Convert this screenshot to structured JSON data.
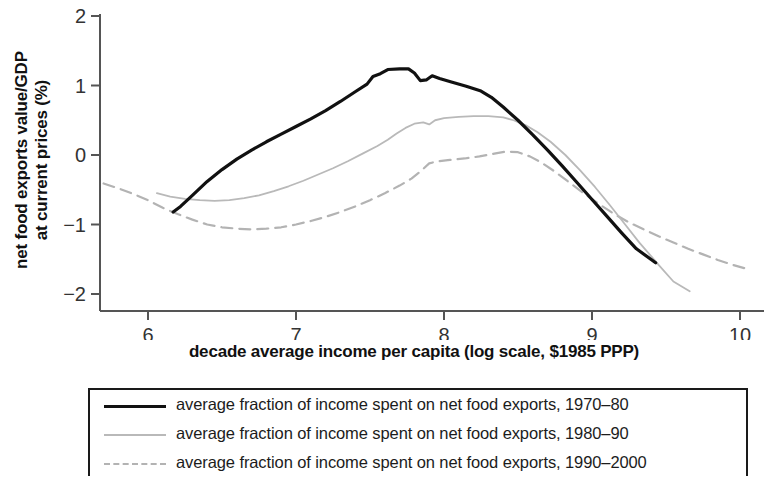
{
  "chart_data": {
    "type": "line",
    "title": "",
    "xlabel": "decade average income per capita (log scale, $1985 PPP)",
    "ylabel": "net food exports value/GDP\nat current prices (%)",
    "xlim": [
      5.62,
      10.1
    ],
    "ylim": [
      -2.15,
      2.15
    ],
    "xticks": [
      6,
      7,
      8,
      9,
      10
    ],
    "yticks": [
      2,
      1,
      0,
      -1,
      -2
    ],
    "xtick_labels": [
      "6",
      "7",
      "8",
      "9",
      "10"
    ],
    "ytick_labels": [
      "2",
      "1",
      "0",
      "−1",
      "−2"
    ],
    "grid": false,
    "legend_position": "below-axes",
    "series": [
      {
        "name": "average fraction of income spent on net food exports, 1970–80",
        "style": "solid",
        "color": "#111111",
        "width": 3.2,
        "points": [
          [
            6.17,
            -0.82
          ],
          [
            6.22,
            -0.74
          ],
          [
            6.3,
            -0.58
          ],
          [
            6.4,
            -0.38
          ],
          [
            6.5,
            -0.21
          ],
          [
            6.6,
            -0.06
          ],
          [
            6.7,
            0.07
          ],
          [
            6.8,
            0.19
          ],
          [
            6.9,
            0.3
          ],
          [
            7.0,
            0.41
          ],
          [
            7.1,
            0.52
          ],
          [
            7.2,
            0.64
          ],
          [
            7.3,
            0.77
          ],
          [
            7.4,
            0.91
          ],
          [
            7.48,
            1.02
          ],
          [
            7.52,
            1.13
          ],
          [
            7.57,
            1.17
          ],
          [
            7.62,
            1.23
          ],
          [
            7.7,
            1.24
          ],
          [
            7.76,
            1.24
          ],
          [
            7.8,
            1.18
          ],
          [
            7.84,
            1.07
          ],
          [
            7.88,
            1.08
          ],
          [
            7.92,
            1.14
          ],
          [
            7.97,
            1.1
          ],
          [
            8.05,
            1.05
          ],
          [
            8.15,
            0.99
          ],
          [
            8.25,
            0.92
          ],
          [
            8.32,
            0.83
          ],
          [
            8.4,
            0.69
          ],
          [
            8.5,
            0.5
          ],
          [
            8.6,
            0.29
          ],
          [
            8.7,
            0.07
          ],
          [
            8.8,
            -0.16
          ],
          [
            8.9,
            -0.4
          ],
          [
            9.0,
            -0.64
          ],
          [
            9.1,
            -0.88
          ],
          [
            9.2,
            -1.12
          ],
          [
            9.3,
            -1.35
          ],
          [
            9.43,
            -1.55
          ]
        ]
      },
      {
        "name": "average fraction of income spent on net food exports, 1980–90",
        "style": "solid",
        "color": "#b9b9b9",
        "width": 1.8,
        "points": [
          [
            6.06,
            -0.55
          ],
          [
            6.15,
            -0.6
          ],
          [
            6.25,
            -0.63
          ],
          [
            6.35,
            -0.65
          ],
          [
            6.45,
            -0.66
          ],
          [
            6.55,
            -0.65
          ],
          [
            6.65,
            -0.62
          ],
          [
            6.75,
            -0.58
          ],
          [
            6.85,
            -0.52
          ],
          [
            6.95,
            -0.45
          ],
          [
            7.05,
            -0.37
          ],
          [
            7.15,
            -0.28
          ],
          [
            7.25,
            -0.19
          ],
          [
            7.35,
            -0.09
          ],
          [
            7.45,
            0.02
          ],
          [
            7.55,
            0.13
          ],
          [
            7.62,
            0.22
          ],
          [
            7.68,
            0.31
          ],
          [
            7.74,
            0.39
          ],
          [
            7.8,
            0.45
          ],
          [
            7.86,
            0.47
          ],
          [
            7.9,
            0.44
          ],
          [
            7.94,
            0.5
          ],
          [
            8.0,
            0.53
          ],
          [
            8.1,
            0.55
          ],
          [
            8.2,
            0.56
          ],
          [
            8.3,
            0.56
          ],
          [
            8.4,
            0.54
          ],
          [
            8.47,
            0.5
          ],
          [
            8.55,
            0.43
          ],
          [
            8.63,
            0.33
          ],
          [
            8.72,
            0.19
          ],
          [
            8.82,
            0.0
          ],
          [
            8.92,
            -0.22
          ],
          [
            9.02,
            -0.46
          ],
          [
            9.12,
            -0.72
          ],
          [
            9.22,
            -0.99
          ],
          [
            9.32,
            -1.26
          ],
          [
            9.45,
            -1.58
          ],
          [
            9.55,
            -1.82
          ],
          [
            9.66,
            -1.96
          ]
        ]
      },
      {
        "name": "average fraction of income spent on net food exports, 1990–2000",
        "style": "dashed",
        "color": "#b3b3b3",
        "width": 2.2,
        "points": [
          [
            5.7,
            -0.41
          ],
          [
            5.8,
            -0.48
          ],
          [
            5.9,
            -0.56
          ],
          [
            6.0,
            -0.65
          ],
          [
            6.1,
            -0.76
          ],
          [
            6.2,
            -0.85
          ],
          [
            6.3,
            -0.93
          ],
          [
            6.4,
            -1.0
          ],
          [
            6.5,
            -1.04
          ],
          [
            6.6,
            -1.06
          ],
          [
            6.7,
            -1.07
          ],
          [
            6.8,
            -1.06
          ],
          [
            6.9,
            -1.04
          ],
          [
            7.0,
            -1.0
          ],
          [
            7.1,
            -0.95
          ],
          [
            7.2,
            -0.89
          ],
          [
            7.3,
            -0.82
          ],
          [
            7.4,
            -0.74
          ],
          [
            7.5,
            -0.65
          ],
          [
            7.6,
            -0.55
          ],
          [
            7.7,
            -0.44
          ],
          [
            7.78,
            -0.34
          ],
          [
            7.85,
            -0.22
          ],
          [
            7.9,
            -0.12
          ],
          [
            7.96,
            -0.09
          ],
          [
            8.04,
            -0.07
          ],
          [
            8.14,
            -0.05
          ],
          [
            8.24,
            -0.02
          ],
          [
            8.34,
            0.02
          ],
          [
            8.42,
            0.05
          ],
          [
            8.5,
            0.04
          ],
          [
            8.58,
            -0.02
          ],
          [
            8.66,
            -0.11
          ],
          [
            8.75,
            -0.24
          ],
          [
            8.85,
            -0.4
          ],
          [
            8.95,
            -0.56
          ],
          [
            9.05,
            -0.71
          ],
          [
            9.15,
            -0.85
          ],
          [
            9.25,
            -0.97
          ],
          [
            9.35,
            -1.07
          ],
          [
            9.45,
            -1.17
          ],
          [
            9.55,
            -1.26
          ],
          [
            9.65,
            -1.35
          ],
          [
            9.75,
            -1.43
          ],
          [
            9.85,
            -1.51
          ],
          [
            9.95,
            -1.58
          ],
          [
            10.05,
            -1.64
          ]
        ]
      }
    ]
  },
  "axis": {
    "ylabel_line1": "net food exports value/GDP",
    "ylabel_line2": "at current prices (%)",
    "xlabel": "decade average income per capita (log scale, $1985 PPP)"
  },
  "legend": {
    "items": [
      {
        "label": "average fraction of income spent on net food exports, 1970–80",
        "style": "solid-black"
      },
      {
        "label": "average fraction of income spent on net food exports, 1980–90",
        "style": "solid-gray"
      },
      {
        "label": "average fraction of income spent on net food exports, 1990–2000",
        "style": "dashed-gray"
      }
    ]
  }
}
